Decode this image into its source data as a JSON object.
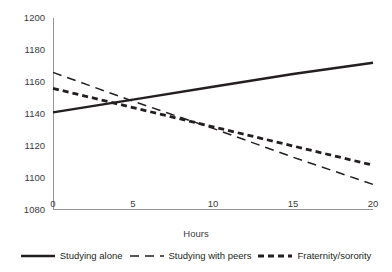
{
  "chart_data": {
    "type": "line",
    "title": "",
    "xlabel": "Hours",
    "ylabel": "",
    "x": [
      0,
      5,
      10,
      15,
      20
    ],
    "xlim": [
      0,
      20
    ],
    "ylim": [
      1080,
      1200
    ],
    "xticks": [
      "0",
      "5",
      "10",
      "15",
      "20"
    ],
    "yticks": [
      "1080",
      "1100",
      "1120",
      "1140",
      "1160",
      "1180",
      "1200"
    ],
    "grid": false,
    "legend_position": "bottom",
    "series": [
      {
        "name": "Studying alone",
        "style": "solid",
        "color": "#231f20",
        "values": [
          1141,
          1149,
          1157,
          1165,
          1172
        ]
      },
      {
        "name": "Studying with peers",
        "style": "long-dash",
        "color": "#231f20",
        "values": [
          1166,
          1148,
          1131,
          1113,
          1096
        ]
      },
      {
        "name": "Fraternity/sorority",
        "style": "short-dash",
        "color": "#231f20",
        "values": [
          1156,
          1144,
          1132,
          1120,
          1108
        ]
      }
    ]
  },
  "axes": {
    "y_ticks": [
      {
        "label": "1200",
        "value": 1200
      },
      {
        "label": "1180",
        "value": 1180
      },
      {
        "label": "1160",
        "value": 1160
      },
      {
        "label": "1140",
        "value": 1140
      },
      {
        "label": "1120",
        "value": 1120
      },
      {
        "label": "1100",
        "value": 1100
      },
      {
        "label": "1080",
        "value": 1080
      }
    ],
    "x_ticks": [
      {
        "label": "0",
        "value": 0
      },
      {
        "label": "5",
        "value": 5
      },
      {
        "label": "10",
        "value": 10
      },
      {
        "label": "15",
        "value": 15
      },
      {
        "label": "20",
        "value": 20
      }
    ],
    "x_axis_title": "Hours"
  },
  "legend": {
    "items": [
      {
        "label": "Studying alone",
        "style": "solid"
      },
      {
        "label": "Studying with peers",
        "style": "long-dash"
      },
      {
        "label": "Fraternity/sorority",
        "style": "short-dash"
      }
    ]
  },
  "colors": {
    "line": "#231f20",
    "axis": "#939598",
    "tick_text": "#3b3b3d"
  }
}
